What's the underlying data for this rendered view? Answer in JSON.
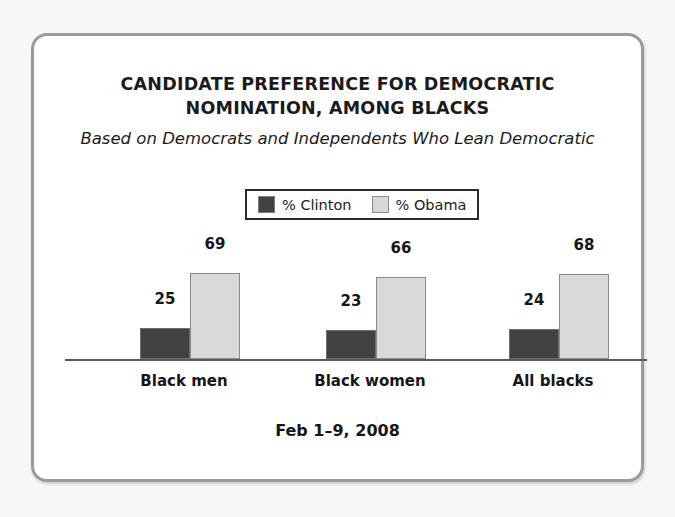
{
  "card": {
    "title_lines": [
      "CANDIDATE PREFERENCE FOR DEMOCRATIC",
      "NOMINATION, AMONG BLACKS"
    ],
    "subtitle": "Based on Democrats and Independents Who Lean Democratic",
    "footer_date": "Feb 1–9, 2008"
  },
  "legend": {
    "entries": [
      {
        "label": "% Clinton",
        "swatch": "clinton-swatch",
        "color": "#424242"
      },
      {
        "label": "% Obama",
        "swatch": "obama-swatch",
        "color": "#d9d9d9"
      }
    ]
  },
  "chart_data": {
    "type": "bar",
    "title": "CANDIDATE PREFERENCE FOR DEMOCRATIC NOMINATION, AMONG BLACKS",
    "subtitle": "Based on Democrats and Independents Who Lean Democratic",
    "categories": [
      "Black men",
      "Black women",
      "All blacks"
    ],
    "series": [
      {
        "name": "% Clinton",
        "color": "#424242",
        "values": [
          25,
          23,
          24
        ]
      },
      {
        "name": "% Obama",
        "color": "#d9d9d9",
        "values": [
          69,
          66,
          68
        ]
      }
    ],
    "xlabel": "",
    "ylabel": "",
    "ylim": [
      0,
      100
    ],
    "grid": false,
    "axis_visible": "baseline-only",
    "legend_position": "top-center",
    "data_labels": true,
    "note": "Feb 1–9, 2008"
  }
}
